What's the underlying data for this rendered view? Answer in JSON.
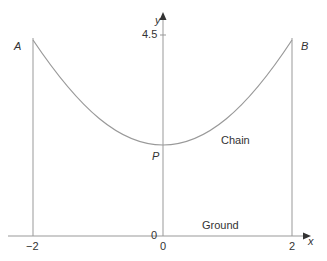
{
  "diagram": {
    "type": "catenary-chain-diagram",
    "points": {
      "A": {
        "label": "A",
        "x": -2
      },
      "B": {
        "label": "B",
        "x": 2
      },
      "P": {
        "label": "P",
        "x": 0,
        "y": 2
      }
    },
    "labels": {
      "chain": "Chain",
      "ground": "Ground"
    },
    "axes": {
      "x_label": "x",
      "y_label": "y",
      "x_ticks": [
        "−2",
        "0",
        "2"
      ],
      "y_ticks": [
        "0",
        "4.5"
      ]
    },
    "colors": {
      "line": "#999999",
      "curve": "#999999",
      "text": "#333333"
    }
  }
}
